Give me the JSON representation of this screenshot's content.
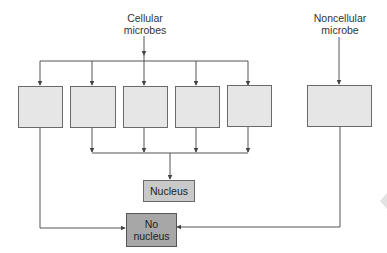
{
  "diagram": {
    "type": "flowchart",
    "sources": [
      {
        "id": "cellular",
        "label_line1": "Cellular",
        "label_line2": "microbes"
      },
      {
        "id": "noncellular",
        "label_line1": "Noncellular",
        "label_line2": "microbe"
      }
    ],
    "cellular_boxes": [
      {
        "id": "cell-box-1",
        "label": ""
      },
      {
        "id": "cell-box-2",
        "label": ""
      },
      {
        "id": "cell-box-3",
        "label": ""
      },
      {
        "id": "cell-box-4",
        "label": ""
      },
      {
        "id": "cell-box-5",
        "label": ""
      }
    ],
    "noncellular_box": {
      "id": "noncell-box-1",
      "label": ""
    },
    "outcomes": {
      "nucleus": {
        "label": "Nucleus"
      },
      "no_nucleus": {
        "label_line1": "No",
        "label_line2": "nucleus"
      }
    },
    "edges": [
      {
        "from": "cellular",
        "to": [
          "cell-box-1",
          "cell-box-2",
          "cell-box-3",
          "cell-box-4",
          "cell-box-5"
        ]
      },
      {
        "from": [
          "cell-box-2",
          "cell-box-3",
          "cell-box-4",
          "cell-box-5"
        ],
        "to": "nucleus"
      },
      {
        "from": "cell-box-1",
        "to": "no_nucleus"
      },
      {
        "from": "noncellular",
        "to": "noncell-box-1"
      },
      {
        "from": "noncell-box-1",
        "to": "no_nucleus"
      }
    ],
    "colors": {
      "empty_box_fill": "#e6e6e6",
      "nucleus_fill": "#c9c9c9",
      "no_nucleus_fill": "#a7a7a7",
      "line": "#555555"
    }
  }
}
